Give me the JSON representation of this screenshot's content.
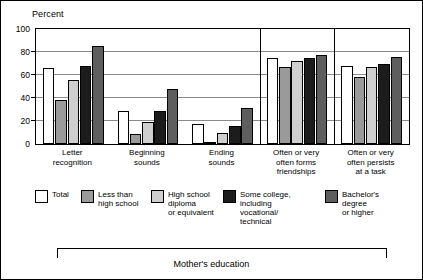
{
  "chart_data": {
    "type": "bar",
    "title": "",
    "ylabel": "Percent",
    "xlabel": "Mother's education",
    "ylim": [
      0,
      100
    ],
    "yticks": [
      0,
      20,
      40,
      60,
      80,
      100
    ],
    "grid": true,
    "legend_position": "bottom",
    "categories": [
      "Letter\nrecognition",
      "Beginning\nsounds",
      "Ending\nsounds",
      "Often or very\noften forms\nfriendships",
      "Often or very\noften persists\nat a task"
    ],
    "series": [
      {
        "name": "Total",
        "color": "#ffffff",
        "values": [
          66,
          29,
          17,
          75,
          68
        ]
      },
      {
        "name": "Less than\nhigh school",
        "color": "#9a9a9a",
        "values": [
          38,
          9,
          2,
          67,
          58
        ]
      },
      {
        "name": "High school\ndiploma\nor equivalent",
        "color": "#cfcfcf",
        "values": [
          56,
          19,
          10,
          72,
          67
        ]
      },
      {
        "name": "Some college,\nincluding\nvocational/\ntechnical",
        "color": "#1c1c1c",
        "values": [
          68,
          29,
          16,
          75,
          70
        ]
      },
      {
        "name": "Bachelor's\ndegree\nor higher",
        "color": "#5e5e5e",
        "values": [
          85,
          48,
          31,
          77,
          76
        ]
      }
    ]
  },
  "legend": {
    "items": [
      {
        "label": "Total",
        "swatch": "sw-total"
      },
      {
        "label": "Less than\nhigh school",
        "swatch": "sw-lths"
      },
      {
        "label": "High school\ndiploma\nor equivalent",
        "swatch": "sw-hs"
      },
      {
        "label": "Some college,\nincluding\nvocational/\ntechnical",
        "swatch": "sw-somecol"
      },
      {
        "label": "Bachelor's\ndegree\nor higher",
        "swatch": "sw-bachelors"
      }
    ]
  }
}
